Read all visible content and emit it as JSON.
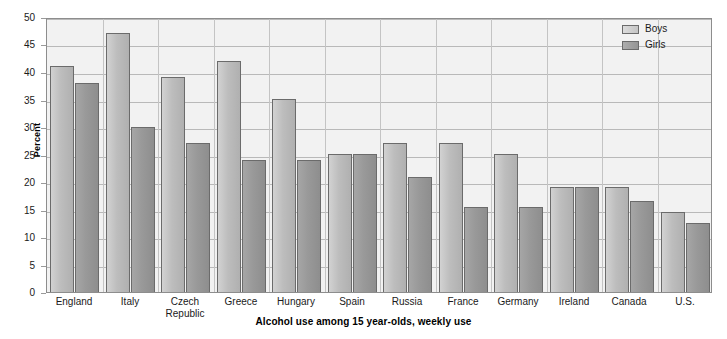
{
  "chart_data": {
    "type": "bar",
    "title": "",
    "subtitle": "Alcohol use among 15 year-olds, weekly use",
    "xlabel": "",
    "ylabel": "Percent",
    "ylim": [
      0,
      50
    ],
    "ytick_step": 5,
    "yticks": [
      "50",
      "45",
      "40",
      "35",
      "30",
      "25",
      "20",
      "15",
      "10",
      "5",
      "0"
    ],
    "grid": true,
    "legend_position": "top-right",
    "categories": [
      "England",
      "Italy",
      "Czech Republic",
      "Greece",
      "Hungary",
      "Spain",
      "Russia",
      "France",
      "Germany",
      "Ireland",
      "Canada",
      "U.S."
    ],
    "category_lines": [
      [
        "England"
      ],
      [
        "Italy"
      ],
      [
        "Czech",
        "Republic"
      ],
      [
        "Greece"
      ],
      [
        "Hungary"
      ],
      [
        "Spain"
      ],
      [
        "Russia"
      ],
      [
        "France"
      ],
      [
        "Germany"
      ],
      [
        "Ireland"
      ],
      [
        "Canada"
      ],
      [
        "U.S."
      ]
    ],
    "series": [
      {
        "name": "Boys",
        "color": "#c4c4c4",
        "values": [
          41,
          47,
          39,
          42,
          35,
          25,
          27,
          27,
          25,
          19,
          19,
          14.5
        ]
      },
      {
        "name": "Girls",
        "color": "#989898",
        "values": [
          38,
          30,
          27,
          24,
          24,
          25,
          21,
          15.5,
          15.5,
          19,
          16.5,
          12.5
        ]
      }
    ]
  },
  "legend": {
    "items": [
      {
        "label": "Boys"
      },
      {
        "label": "Girls"
      }
    ]
  },
  "axis": {
    "y_title": "Percent"
  },
  "caption": {
    "text": "Alcohol use among 15 year-olds, weekly use"
  }
}
